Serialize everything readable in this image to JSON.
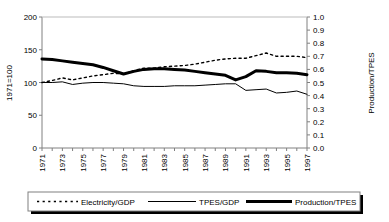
{
  "chart_data": {
    "type": "line",
    "title": "",
    "xlabel": "",
    "ylabel": "1971=100",
    "ylabel_right": "Production/TPES",
    "grid": false,
    "legend_position": "bottom",
    "ylim": [
      0,
      200
    ],
    "yticks": [
      "0",
      "50",
      "100",
      "150",
      "200"
    ],
    "ylim_right": [
      0.0,
      1.0
    ],
    "yticks_right": [
      "0.0",
      "0.1",
      "0.2",
      "0.3",
      "0.4",
      "0.5",
      "0.6",
      "0.7",
      "0.8",
      "0.9",
      "1.0"
    ],
    "x": [
      1971,
      1972,
      1973,
      1974,
      1975,
      1976,
      1977,
      1978,
      1979,
      1980,
      1981,
      1982,
      1983,
      1984,
      1985,
      1986,
      1987,
      1988,
      1989,
      1990,
      1991,
      1992,
      1993,
      1994,
      1995,
      1996,
      1997
    ],
    "xtick_labels": [
      "1971",
      "1973",
      "1975",
      "1977",
      "1979",
      "1981",
      "1983",
      "1985",
      "1987",
      "1989",
      "1991",
      "1993",
      "1995",
      "1997"
    ],
    "series": [
      {
        "name": "Electricity/GDP",
        "axis": "left",
        "style": "dotted",
        "values": [
          100,
          103,
          107,
          104,
          107,
          110,
          112,
          114,
          113,
          118,
          122,
          122,
          124,
          125,
          126,
          128,
          131,
          134,
          136,
          137,
          137,
          141,
          145,
          140,
          140,
          140,
          138
        ]
      },
      {
        "name": "TPES/GDP",
        "axis": "left",
        "style": "thin-solid",
        "values": [
          100,
          100,
          101,
          97,
          99,
          100,
          100,
          99,
          98,
          95,
          94,
          94,
          94,
          95,
          95,
          95,
          96,
          97,
          98,
          98,
          88,
          89,
          90,
          84,
          85,
          87,
          82
        ]
      },
      {
        "name": "Production/TPES",
        "axis": "right",
        "style": "thick-solid",
        "values": [
          0.68,
          0.675,
          0.665,
          0.655,
          0.645,
          0.635,
          0.615,
          0.59,
          0.565,
          0.585,
          0.6,
          0.605,
          0.605,
          0.6,
          0.595,
          0.585,
          0.575,
          0.565,
          0.555,
          0.52,
          0.545,
          0.59,
          0.585,
          0.575,
          0.575,
          0.57,
          0.56
        ]
      }
    ]
  },
  "legend": {
    "items": [
      {
        "label": "Electricity/GDP",
        "style": "dotted"
      },
      {
        "label": "TPES/GDP",
        "style": "thin-solid"
      },
      {
        "label": "Production/TPES",
        "style": "thick-solid"
      }
    ]
  },
  "colors": {
    "line": "#000000",
    "axis": "#808080",
    "background": "#ffffff",
    "legend_shadow": "#000000"
  }
}
